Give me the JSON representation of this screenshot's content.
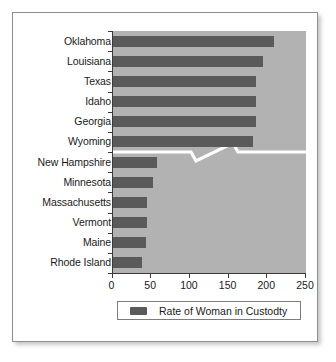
{
  "chart_data": {
    "type": "bar",
    "orientation": "horizontal",
    "title": "",
    "xlabel": "",
    "ylabel": "",
    "xlim": [
      0,
      250
    ],
    "xticks": [
      0,
      50,
      100,
      150,
      200,
      250
    ],
    "grid": false,
    "legend_position": "bottom",
    "legend_entries": [
      "Rate of Woman in Custodty"
    ],
    "series_name": "Rate of Woman in Custodty",
    "bar_color": "#5a5a5a",
    "plot_background": "#b2b2b2",
    "axis_break": {
      "present": true,
      "color": "#ffffff",
      "between_categories": [
        "Wyoming",
        "New Hampshire"
      ]
    },
    "categories": [
      "Oklahoma",
      "Louisiana",
      "Texas",
      "Idaho",
      "Georgia",
      "Wyoming",
      "New Hampshire",
      "Minnesota",
      "Massachusetts",
      "Vermont",
      "Maine",
      "Rhode Island"
    ],
    "values": [
      209,
      195,
      185,
      185,
      185,
      182,
      58,
      52,
      45,
      45,
      43,
      38
    ]
  },
  "legend": {
    "label": "Rate of Woman in Custodty"
  }
}
